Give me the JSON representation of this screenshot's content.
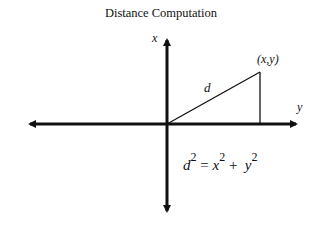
{
  "title": "Distance Computation",
  "axes": {
    "vertical_label": "x",
    "horizontal_label": "y"
  },
  "point_label": "(x,y)",
  "hypotenuse_label": "d",
  "equation": {
    "lhs_var": "d",
    "lhs_exp": "2",
    "equals": "=",
    "term1_var": "x",
    "term1_exp": "2",
    "plus": "+",
    "term2_var": "y",
    "term2_exp": "2"
  },
  "colors": {
    "ink": "#111111",
    "background": "#ffffff"
  }
}
